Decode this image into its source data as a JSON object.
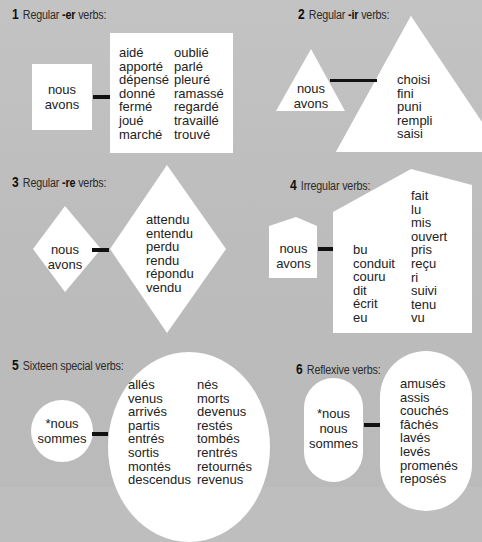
{
  "sections": [
    {
      "number": "1",
      "title_prefix": "Regular ",
      "title_ending": "-er",
      "title_suffix": " verbs:",
      "auxiliary": [
        "nous",
        "avons"
      ],
      "shape": "rectangle",
      "columns": [
        [
          "aidé",
          "apporté",
          "dépensé",
          "donné",
          "fermé",
          "joué",
          "marché"
        ],
        [
          "oublié",
          "parlé",
          "pleuré",
          "ramassé",
          "regardé",
          "travaillé",
          "trouvé"
        ]
      ]
    },
    {
      "number": "2",
      "title_prefix": "Regular ",
      "title_ending": "-ir",
      "title_suffix": " verbs:",
      "auxiliary": [
        "nous",
        "avons"
      ],
      "shape": "triangle",
      "columns": [
        [
          "choisi",
          "fini",
          "puni",
          "rempli",
          "saisi"
        ]
      ]
    },
    {
      "number": "3",
      "title_prefix": "Regular ",
      "title_ending": "-re",
      "title_suffix": " verbs:",
      "auxiliary": [
        "nous",
        "avons"
      ],
      "shape": "diamond",
      "columns": [
        [
          "attendu",
          "entendu",
          "perdu",
          "rendu",
          "répondu",
          "vendu"
        ]
      ]
    },
    {
      "number": "4",
      "title_prefix": "Irregular verbs:",
      "title_ending": "",
      "title_suffix": "",
      "auxiliary": [
        "nous",
        "avons"
      ],
      "shape": "house",
      "columns": [
        [
          "bu",
          "conduit",
          "couru",
          "dit",
          "écrit",
          "eu"
        ],
        [
          "fait",
          "lu",
          "mis",
          "ouvert",
          "pris",
          "reçu",
          "ri",
          "suivi",
          "tenu",
          "vu"
        ]
      ]
    },
    {
      "number": "5",
      "title_prefix": "Sixteen special verbs:",
      "title_ending": "",
      "title_suffix": "",
      "auxiliary": [
        "*nous",
        "sommes"
      ],
      "shape": "circle",
      "columns": [
        [
          "allés",
          "venus",
          "arrivés",
          "partis",
          "entrés",
          "sortis",
          "montés",
          "descendus"
        ],
        [
          "nés",
          "morts",
          "devenus",
          "restés",
          "tombés",
          "rentrés",
          "retournés",
          "revenus"
        ]
      ]
    },
    {
      "number": "6",
      "title_prefix": "Reflexive verbs:",
      "title_ending": "",
      "title_suffix": "",
      "auxiliary": [
        "*nous",
        "nous",
        "sommes"
      ],
      "shape": "pill",
      "columns": [
        [
          "amusés",
          "assis",
          "couchés",
          "fâchés",
          "lavés",
          "levés",
          "promenés",
          "reposés"
        ]
      ]
    }
  ],
  "colors": {
    "background": "#bebebe",
    "shape_fill": "#ffffff",
    "connector": "#111111",
    "text": "#222222"
  }
}
